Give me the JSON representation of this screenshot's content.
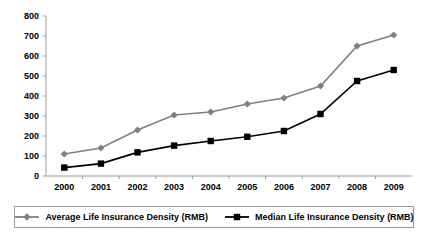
{
  "chart_data": {
    "type": "line",
    "title": "",
    "xlabel": "",
    "ylabel": "",
    "categories": [
      "2000",
      "2001",
      "2002",
      "2003",
      "2004",
      "2005",
      "2006",
      "2007",
      "2008",
      "2009"
    ],
    "series": [
      {
        "name": "Average Life Insurance Density (RMB)",
        "color": "#808080",
        "marker": "diamond",
        "values": [
          110,
          140,
          230,
          305,
          320,
          360,
          390,
          450,
          650,
          705
        ]
      },
      {
        "name": "Median Life Insurance Density (RMB)",
        "color": "#000000",
        "marker": "square",
        "values": [
          42,
          62,
          118,
          152,
          175,
          196,
          225,
          310,
          475,
          530
        ]
      }
    ],
    "ylim": [
      0,
      800
    ],
    "yticks": [
      0,
      100,
      200,
      300,
      400,
      500,
      600,
      700,
      800
    ],
    "ytick_labels": [
      "0",
      "100",
      "200",
      "300",
      "400",
      "500",
      "600",
      "700",
      "800"
    ],
    "grid": false,
    "legend_position": "bottom"
  },
  "legend": {
    "entries": [
      {
        "label": "Average Life Insurance Density (RMB)"
      },
      {
        "label": "Median Life Insurance Density (RMB)"
      }
    ]
  }
}
